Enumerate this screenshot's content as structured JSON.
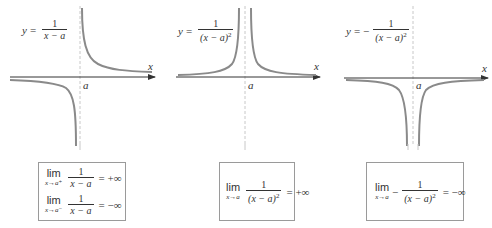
{
  "colors": {
    "curve": "#8a8a8a",
    "axis": "#333333",
    "asymptote": "#c8c8c8",
    "box_border": "#9a9a9a",
    "text": "#333333"
  },
  "panels": [
    {
      "equation": {
        "lhs": "y",
        "equals": "=",
        "sign": "",
        "numerator": "1",
        "denominator": "x − a",
        "exponent": ""
      },
      "axis_label": "x",
      "asymptote_label": "a",
      "limits": [
        {
          "word": "lim",
          "sub": "x→a⁺",
          "numerator": "1",
          "denominator": "x − a",
          "exponent": "",
          "sign": "",
          "result": "= +∞"
        },
        {
          "word": "lim",
          "sub": "x→a⁻",
          "numerator": "1",
          "denominator": "x − a",
          "exponent": "",
          "sign": "",
          "result": "= −∞"
        }
      ]
    },
    {
      "equation": {
        "lhs": "y",
        "equals": "=",
        "sign": "",
        "numerator": "1",
        "denominator": "(x − a)",
        "exponent": "2"
      },
      "axis_label": "x",
      "asymptote_label": "a",
      "limits": [
        {
          "word": "lim",
          "sub": "x→a",
          "numerator": "1",
          "denominator": "(x − a)",
          "exponent": "2",
          "sign": "",
          "result": "= +∞"
        }
      ]
    },
    {
      "equation": {
        "lhs": "y",
        "equals": "=",
        "sign": "−",
        "numerator": "1",
        "denominator": "(x − a)",
        "exponent": "2"
      },
      "axis_label": "x",
      "asymptote_label": "a",
      "limits": [
        {
          "word": "lim",
          "sub": "x→a",
          "numerator": "1",
          "denominator": "(x − a)",
          "exponent": "2",
          "sign": "−",
          "result": "= −∞"
        }
      ]
    }
  ]
}
